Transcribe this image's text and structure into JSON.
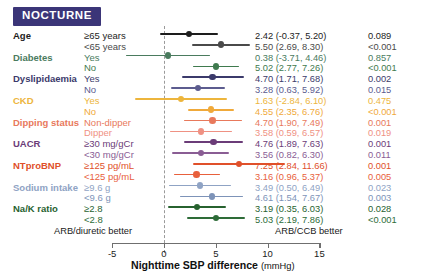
{
  "header": {
    "badge_label": "NOCTURNE",
    "badge_color": "#3b3578"
  },
  "axis": {
    "title": "Nighttime SBP difference",
    "unit": "(mmHg)",
    "ticks": [
      -5,
      0,
      5,
      10,
      15
    ],
    "tick_labels": [
      "-5",
      "0",
      "5",
      "10",
      "15"
    ],
    "xmin": -6.2,
    "xmax": 16.2,
    "left_annotation": "ARB/diuretic better",
    "right_annotation": "ARB/CCB better",
    "zero_reference": 0
  },
  "columns": {
    "group": "",
    "subgroup": "",
    "estimate": "",
    "pvalue": ""
  },
  "chart_data": {
    "type": "forest",
    "title": "NOCTURNE",
    "xlabel": "Nighttime SBP difference (mmHg)",
    "ylabel": "",
    "xlim": [
      -6.2,
      16.2
    ],
    "xticks": [
      -5,
      0,
      5,
      10,
      15
    ],
    "grid": false,
    "reference_line": 0,
    "legend": "none",
    "rows": [
      {
        "group": "Age",
        "subgroup": "≥65 years",
        "estimate": 2.42,
        "ci_low": -0.37,
        "ci_high": 5.2,
        "estimate_text": "2.42 (-0.37, 5.20)",
        "p_text": "0.089",
        "color": "#1d1d1d"
      },
      {
        "group": "",
        "subgroup": "<65 years",
        "estimate": 5.5,
        "ci_low": 2.69,
        "ci_high": 8.3,
        "estimate_text": "5.50 (2.69, 8.30)",
        "p_text": "<0.001",
        "color": "#4a4a4a"
      },
      {
        "group": "Diabetes",
        "subgroup": "Yes",
        "estimate": 0.38,
        "ci_low": -3.71,
        "ci_high": 4.46,
        "estimate_text": "0.38 (-3.71, 4.46)",
        "p_text": "0.857",
        "color": "#4a7b5e"
      },
      {
        "group": "",
        "subgroup": "No",
        "estimate": 5.02,
        "ci_low": 2.77,
        "ci_high": 7.26,
        "estimate_text": "5.02 (2.77, 7.26)",
        "p_text": "<0.001",
        "color": "#3f7a4e"
      },
      {
        "group": "Dyslipidaemia",
        "subgroup": "Yes",
        "estimate": 4.7,
        "ci_low": 1.71,
        "ci_high": 7.68,
        "estimate_text": "4.70 (1.71, 7.68)",
        "p_text": "0.002",
        "color": "#3b3a6b"
      },
      {
        "group": "",
        "subgroup": "No",
        "estimate": 3.28,
        "ci_low": 0.63,
        "ci_high": 5.92,
        "estimate_text": "3.28 (0.63, 5.92)",
        "p_text": "0.015",
        "color": "#5c5c8f"
      },
      {
        "group": "CKD",
        "subgroup": "Yes",
        "estimate": 1.63,
        "ci_low": -2.84,
        "ci_high": 6.1,
        "estimate_text": "1.63 (-2.84, 6.10)",
        "p_text": "0.475",
        "color": "#edb53c"
      },
      {
        "group": "",
        "subgroup": "No",
        "estimate": 4.55,
        "ci_low": 2.35,
        "ci_high": 6.76,
        "estimate_text": "4.55 (2.35, 6.76)",
        "p_text": "<0.001",
        "color": "#f0a93a"
      },
      {
        "group": "Dipping status",
        "subgroup": "Non-dipper",
        "estimate": 4.7,
        "ci_low": 1.9,
        "ci_high": 7.49,
        "estimate_text": "4.70 (1.90, 7.49)",
        "p_text": "0.001",
        "color": "#e8795c"
      },
      {
        "group": "",
        "subgroup": "Dipper",
        "estimate": 3.58,
        "ci_low": 0.59,
        "ci_high": 6.57,
        "estimate_text": "3.58 (0.59, 6.57)",
        "p_text": "0.019",
        "color": "#ef9183"
      },
      {
        "group": "UACR",
        "subgroup": "≥30 mg/gCr",
        "estimate": 4.76,
        "ci_low": 1.89,
        "ci_high": 7.63,
        "estimate_text": "4.76 (1.89, 7.63)",
        "p_text": "0.001",
        "color": "#6b3c78"
      },
      {
        "group": "",
        "subgroup": "<30 mg/gCr",
        "estimate": 3.56,
        "ci_low": 0.82,
        "ci_high": 6.3,
        "estimate_text": "3.56 (0.82, 6.30)",
        "p_text": "0.011",
        "color": "#8a5d94"
      },
      {
        "group": "NTproBNP",
        "subgroup": "≥125 pg/mL",
        "estimate": 7.25,
        "ci_low": 2.84,
        "ci_high": 11.66,
        "estimate_text": "7.25 (2.84, 11.66)",
        "p_text": "0.001",
        "color": "#e0502a"
      },
      {
        "group": "",
        "subgroup": "<125 pg/mL",
        "estimate": 3.16,
        "ci_low": 0.96,
        "ci_high": 5.37,
        "estimate_text": "3.16 (0.96, 5.37)",
        "p_text": "0.005",
        "color": "#e8603c"
      },
      {
        "group": "Sodium intake",
        "subgroup": "≥9.6 g",
        "estimate": 3.49,
        "ci_low": 0.5,
        "ci_high": 6.49,
        "estimate_text": "3.49 (0.50, 6.49)",
        "p_text": "0.023",
        "color": "#8fa3c4"
      },
      {
        "group": "",
        "subgroup": "<9.6 g",
        "estimate": 4.61,
        "ci_low": 1.54,
        "ci_high": 7.67,
        "estimate_text": "4.61 (1.54, 7.67)",
        "p_text": "0.003",
        "color": "#7d93b8"
      },
      {
        "group": "Na/K ratio",
        "subgroup": "≥2.8",
        "estimate": 3.19,
        "ci_low": 0.35,
        "ci_high": 6.03,
        "estimate_text": "3.19 (0.35, 6.03)",
        "p_text": "0.028",
        "color": "#27622f"
      },
      {
        "group": "",
        "subgroup": "<2.8",
        "estimate": 5.03,
        "ci_low": 2.19,
        "ci_high": 7.86,
        "estimate_text": "5.03 (2.19, 7.86)",
        "p_text": "<0.001",
        "color": "#2e6c38"
      }
    ]
  }
}
